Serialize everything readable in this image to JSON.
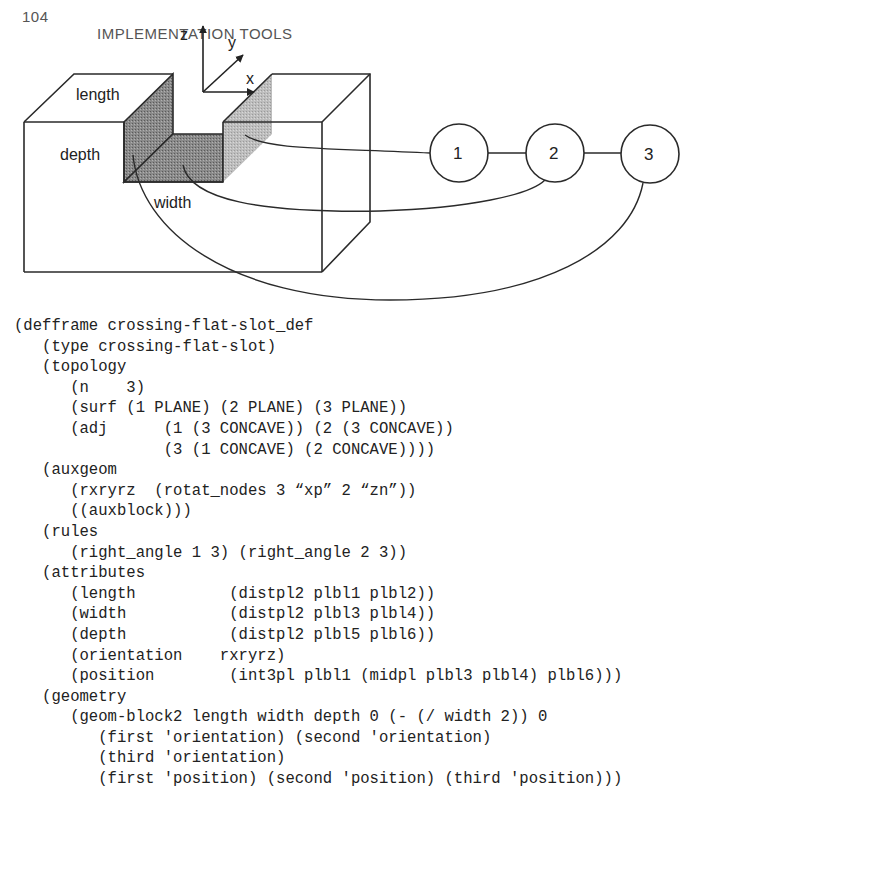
{
  "header": {
    "page_number": "104",
    "running_title": "IMPLEMENTATION TOOLS"
  },
  "figure": {
    "axes": {
      "z": "z",
      "y": "y",
      "x": "x"
    },
    "labels": {
      "length": "length",
      "depth": "depth",
      "width": "width"
    },
    "nodes": [
      {
        "id": "1",
        "label": "1"
      },
      {
        "id": "2",
        "label": "2"
      },
      {
        "id": "3",
        "label": "3"
      }
    ],
    "colors": {
      "stroke": "#2a2a2a",
      "shade_dark": "#7a7a7a",
      "shade_light": "#b5b5b5"
    }
  },
  "code": {
    "lines": [
      "(defframe crossing-flat-slot_def",
      "   (type crossing-flat-slot)",
      "   (topology",
      "      (n    3)",
      "      (surf (1 PLANE) (2 PLANE) (3 PLANE))",
      "      (adj      (1 (3 CONCAVE)) (2 (3 CONCAVE))",
      "                (3 (1 CONCAVE) (2 CONCAVE))))",
      "   (auxgeom",
      "      (rxryrz  (rotat_nodes 3 “xp” 2 “zn”))",
      "      ((auxblock)))",
      "   (rules",
      "      (right_angle 1 3) (right_angle 2 3))",
      "   (attributes",
      "      (length          (distpl2 plbl1 plbl2))",
      "      (width           (distpl2 plbl3 plbl4))",
      "      (depth           (distpl2 plbl5 plbl6))",
      "      (orientation    rxryrz)",
      "      (position        (int3pl plbl1 (midpl plbl3 plbl4) plbl6)))",
      "   (geometry",
      "      (geom-block2 length width depth 0 (- (/ width 2)) 0",
      "         (first 'orientation) (second 'orientation)",
      "         (third 'orientation)",
      "         (first 'position) (second 'position) (third 'position)))"
    ]
  }
}
